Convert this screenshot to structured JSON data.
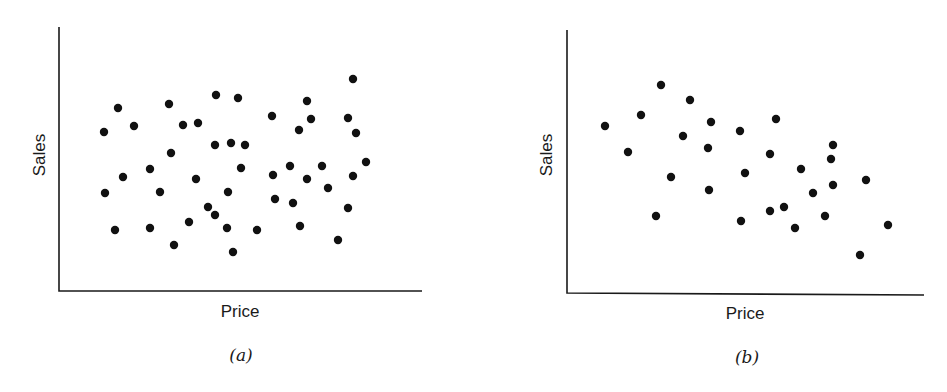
{
  "chart_data": [
    {
      "type": "scatter",
      "panel": "(a)",
      "title": "",
      "caption": "(a)",
      "xlabel": "Price",
      "ylabel": "Sales",
      "grid": false,
      "legend": null,
      "ticks": "none",
      "note": "Coordinates in plot pixel space (x: 59-422 left-to-right, y: 27-291 top-to-bottom); no numeric scale shown. No apparent relationship.",
      "axes_px": {
        "x0": 59,
        "x1": 422,
        "y_top": 27,
        "y_base": 291
      },
      "points": [
        [
          104,
          132
        ],
        [
          118,
          108
        ],
        [
          134,
          126
        ],
        [
          105,
          193
        ],
        [
          123,
          177
        ],
        [
          115,
          230
        ],
        [
          150,
          169
        ],
        [
          160,
          192
        ],
        [
          150,
          228
        ],
        [
          169,
          104
        ],
        [
          171,
          153
        ],
        [
          183,
          125
        ],
        [
          198,
          123
        ],
        [
          174,
          245
        ],
        [
          189,
          222
        ],
        [
          196,
          179
        ],
        [
          216,
          95
        ],
        [
          238,
          98
        ],
        [
          215,
          145
        ],
        [
          231,
          143
        ],
        [
          245,
          145
        ],
        [
          241,
          168
        ],
        [
          228,
          192
        ],
        [
          208,
          207
        ],
        [
          215,
          215
        ],
        [
          227,
          228
        ],
        [
          233,
          252
        ],
        [
          257,
          230
        ],
        [
          272,
          116
        ],
        [
          273,
          175
        ],
        [
          275,
          199
        ],
        [
          290,
          166
        ],
        [
          293,
          203
        ],
        [
          300,
          226
        ],
        [
          299,
          130
        ],
        [
          307,
          101
        ],
        [
          311,
          119
        ],
        [
          307,
          179
        ],
        [
          322,
          166
        ],
        [
          328,
          188
        ],
        [
          338,
          240
        ],
        [
          348,
          208
        ],
        [
          348,
          118
        ],
        [
          356,
          133
        ],
        [
          353,
          176
        ],
        [
          353,
          79
        ],
        [
          366,
          162
        ]
      ]
    },
    {
      "type": "scatter",
      "panel": "(b)",
      "title": "",
      "caption": "(b)",
      "xlabel": "Price",
      "ylabel": "Sales",
      "grid": false,
      "legend": null,
      "ticks": "none",
      "note": "Coordinates in plot pixel space (x: 567-924 left-to-right, y: 30-294 top-to-bottom); no numeric scale shown. Negative relationship: sales fall as price rises.",
      "axes_px": {
        "x0": 567,
        "x1": 924,
        "y_top": 30,
        "y_base": 294
      },
      "points": [
        [
          605,
          126
        ],
        [
          628,
          152
        ],
        [
          641,
          115
        ],
        [
          661,
          85
        ],
        [
          656,
          216
        ],
        [
          671,
          177
        ],
        [
          683,
          136
        ],
        [
          690,
          100
        ],
        [
          708,
          148
        ],
        [
          711,
          122
        ],
        [
          709,
          190
        ],
        [
          740,
          131
        ],
        [
          745,
          173
        ],
        [
          741,
          221
        ],
        [
          770,
          154
        ],
        [
          776,
          119
        ],
        [
          770,
          211
        ],
        [
          784,
          207
        ],
        [
          795,
          228
        ],
        [
          801,
          169
        ],
        [
          813,
          193
        ],
        [
          825,
          216
        ],
        [
          833,
          145
        ],
        [
          831,
          159
        ],
        [
          833,
          185
        ],
        [
          866,
          180
        ],
        [
          860,
          255
        ],
        [
          888,
          225
        ]
      ]
    }
  ],
  "panels": {
    "a": {
      "ylabel": "Sales",
      "xlabel": "Price",
      "caption": "(a)"
    },
    "b": {
      "ylabel": "Sales",
      "xlabel": "Price",
      "caption": "(b)"
    }
  },
  "colors": {
    "ink": "#111111",
    "background": "#ffffff"
  }
}
